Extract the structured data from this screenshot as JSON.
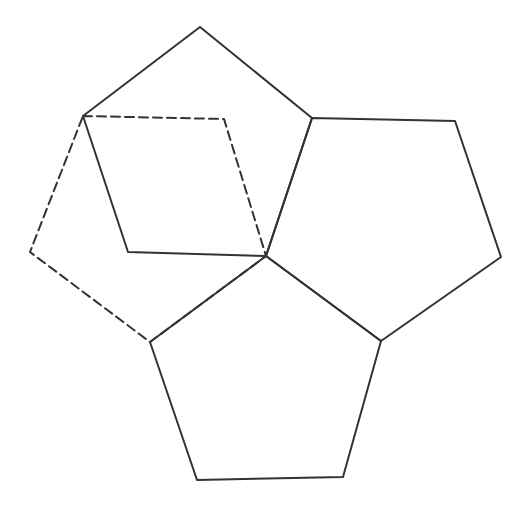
{
  "figure": {
    "background_color": "#ffffff",
    "stroke_color": "#333333",
    "stroke_width": 2,
    "dash_pattern": "9 5",
    "canvas": {
      "width": 526,
      "height": 511
    }
  },
  "chart_data": {
    "type": "diagram",
    "xlabel": "",
    "ylabel": "",
    "xlim": [
      0,
      526
    ],
    "ylim": [
      0,
      511
    ],
    "grid": false,
    "legend": "none",
    "coordinate_system": "image pixels, origin top-left, y increases downward",
    "vertices": {
      "top_apex": [
        200,
        27
      ],
      "top_left_shared": [
        83,
        116
      ],
      "top_right_shared": [
        312,
        118
      ],
      "left_lower": [
        128,
        252
      ],
      "center_junction": [
        266,
        256
      ],
      "dashed_top_right": [
        224,
        119
      ],
      "dashed_left": [
        30,
        252
      ],
      "dashed_bottom": [
        150,
        342
      ],
      "right_top_right": [
        455,
        121
      ],
      "right_right": [
        501,
        257
      ],
      "right_bottom_junction": [
        381,
        341
      ],
      "bottom_left_junction": [
        150,
        342
      ],
      "bottom_bottom_left": [
        197,
        480
      ],
      "bottom_bottom_right": [
        343,
        477
      ]
    },
    "shapes": [
      {
        "name": "top-left-pentagon",
        "style": "solid",
        "points": [
          [
            200,
            27
          ],
          [
            312,
            118
          ],
          [
            266,
            256
          ],
          [
            128,
            252
          ],
          [
            83,
            116
          ]
        ]
      },
      {
        "name": "right-pentagon",
        "style": "solid",
        "points": [
          [
            312,
            118
          ],
          [
            455,
            121
          ],
          [
            501,
            257
          ],
          [
            381,
            341
          ],
          [
            266,
            256
          ]
        ]
      },
      {
        "name": "bottom-pentagon",
        "style": "solid",
        "points": [
          [
            266,
            256
          ],
          [
            381,
            341
          ],
          [
            343,
            477
          ],
          [
            197,
            480
          ],
          [
            150,
            342
          ]
        ]
      },
      {
        "name": "dashed-pentagon",
        "style": "dashed",
        "points": [
          [
            83,
            116
          ],
          [
            224,
            119
          ],
          [
            266,
            256
          ],
          [
            150,
            342
          ],
          [
            30,
            252
          ]
        ]
      }
    ],
    "counts": {
      "solid_pentagons": 3,
      "dashed_pentagons": 1,
      "total_pentagons": 4
    }
  }
}
